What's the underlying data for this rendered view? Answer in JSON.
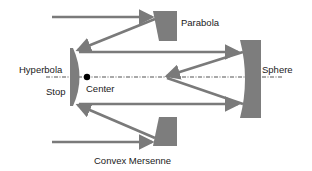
{
  "diagram": {
    "title": "",
    "labels": {
      "parabola": "Parabola",
      "hyperbola": "Hyperbola",
      "stop": "Stop",
      "center": "Center",
      "sphere": "Sphere",
      "convex_mersenne": "Convex Mersenne"
    },
    "elements": [
      {
        "id": "parabola",
        "type": "mirror",
        "label": "Parabola"
      },
      {
        "id": "hyperbola",
        "type": "mirror",
        "label": "Hyperbola"
      },
      {
        "id": "sphere",
        "type": "mirror",
        "label": "Sphere"
      },
      {
        "id": "convex-mersenne",
        "type": "mirror",
        "label": "Convex Mersenne"
      },
      {
        "id": "center",
        "type": "point",
        "label": "Center"
      },
      {
        "id": "stop",
        "type": "aperture",
        "label": "Stop"
      }
    ],
    "colors": {
      "mirror": "#7d7d7d",
      "ray": "#7a7a7a",
      "axis": "#555555",
      "center_dot": "#000000",
      "text": "#1a1a1a"
    }
  }
}
